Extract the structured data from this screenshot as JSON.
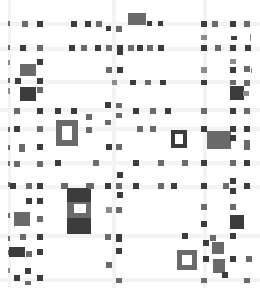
{
  "map": {
    "width": 260,
    "height": 288,
    "background": "#ffffff",
    "colors": {
      "dark": "#3c3c3c",
      "mid": "#6a6a6a",
      "light": "#8c8c8c",
      "road": "#f3f3f3"
    },
    "roads": [
      {
        "x": 0,
        "y": 22,
        "w": 260,
        "h": 4
      },
      {
        "x": 0,
        "y": 47,
        "w": 260,
        "h": 4
      },
      {
        "x": 0,
        "y": 80,
        "w": 260,
        "h": 4
      },
      {
        "x": 0,
        "y": 108,
        "w": 260,
        "h": 4
      },
      {
        "x": 0,
        "y": 127,
        "w": 260,
        "h": 4
      },
      {
        "x": 0,
        "y": 161,
        "w": 260,
        "h": 4
      },
      {
        "x": 0,
        "y": 185,
        "w": 260,
        "h": 4
      },
      {
        "x": 0,
        "y": 234,
        "w": 260,
        "h": 4
      },
      {
        "x": 0,
        "y": 278,
        "w": 260,
        "h": 4
      },
      {
        "x": 8,
        "y": 0,
        "w": 3,
        "h": 288
      },
      {
        "x": 112,
        "y": 0,
        "w": 4,
        "h": 288
      },
      {
        "x": 203,
        "y": 0,
        "w": 4,
        "h": 288
      }
    ],
    "tiles": [
      {
        "x": 8,
        "y": 21,
        "w": 2,
        "h": 5,
        "tone": "mid"
      },
      {
        "x": 22,
        "y": 21,
        "w": 6,
        "h": 6,
        "tone": "mid"
      },
      {
        "x": 37,
        "y": 21,
        "w": 6,
        "h": 6,
        "tone": "dark"
      },
      {
        "x": 71,
        "y": 21,
        "w": 6,
        "h": 6,
        "tone": "dark"
      },
      {
        "x": 85,
        "y": 21,
        "w": 6,
        "h": 6,
        "tone": "dark"
      },
      {
        "x": 96,
        "y": 21,
        "w": 6,
        "h": 6,
        "tone": "mid"
      },
      {
        "x": 106,
        "y": 26,
        "w": 5,
        "h": 5,
        "tone": "dark"
      },
      {
        "x": 116,
        "y": 26,
        "w": 6,
        "h": 6,
        "tone": "mid"
      },
      {
        "x": 128,
        "y": 13,
        "w": 18,
        "h": 12,
        "tone": "mid"
      },
      {
        "x": 147,
        "y": 21,
        "w": 5,
        "h": 5,
        "tone": "dark"
      },
      {
        "x": 158,
        "y": 21,
        "w": 5,
        "h": 5,
        "tone": "dark"
      },
      {
        "x": 201,
        "y": 21,
        "w": 6,
        "h": 6,
        "tone": "dark"
      },
      {
        "x": 212,
        "y": 21,
        "w": 6,
        "h": 6,
        "tone": "mid"
      },
      {
        "x": 230,
        "y": 21,
        "w": 6,
        "h": 6,
        "tone": "dark"
      },
      {
        "x": 244,
        "y": 21,
        "w": 6,
        "h": 6,
        "tone": "mid"
      },
      {
        "x": 8,
        "y": 45,
        "w": 2,
        "h": 5,
        "tone": "mid"
      },
      {
        "x": 20,
        "y": 45,
        "w": 6,
        "h": 6,
        "tone": "dark"
      },
      {
        "x": 37,
        "y": 45,
        "w": 6,
        "h": 6,
        "tone": "mid"
      },
      {
        "x": 69,
        "y": 45,
        "w": 6,
        "h": 6,
        "tone": "dark"
      },
      {
        "x": 81,
        "y": 45,
        "w": 6,
        "h": 6,
        "tone": "mid"
      },
      {
        "x": 95,
        "y": 45,
        "w": 6,
        "h": 6,
        "tone": "dark"
      },
      {
        "x": 106,
        "y": 45,
        "w": 6,
        "h": 6,
        "tone": "mid"
      },
      {
        "x": 117,
        "y": 45,
        "w": 6,
        "h": 10,
        "tone": "dark"
      },
      {
        "x": 128,
        "y": 45,
        "w": 6,
        "h": 6,
        "tone": "mid"
      },
      {
        "x": 137,
        "y": 45,
        "w": 6,
        "h": 6,
        "tone": "dark"
      },
      {
        "x": 147,
        "y": 45,
        "w": 6,
        "h": 6,
        "tone": "mid"
      },
      {
        "x": 158,
        "y": 45,
        "w": 6,
        "h": 6,
        "tone": "dark"
      },
      {
        "x": 201,
        "y": 35,
        "w": 6,
        "h": 5,
        "tone": "light"
      },
      {
        "x": 231,
        "y": 36,
        "w": 6,
        "h": 4,
        "tone": "dark"
      },
      {
        "x": 250,
        "y": 34,
        "w": 1,
        "h": 7,
        "tone": "light"
      },
      {
        "x": 201,
        "y": 45,
        "w": 6,
        "h": 6,
        "tone": "dark"
      },
      {
        "x": 215,
        "y": 45,
        "w": 6,
        "h": 6,
        "tone": "mid"
      },
      {
        "x": 230,
        "y": 45,
        "w": 6,
        "h": 6,
        "tone": "dark"
      },
      {
        "x": 245,
        "y": 45,
        "w": 6,
        "h": 6,
        "tone": "dark"
      },
      {
        "x": 8,
        "y": 60,
        "w": 2,
        "h": 5,
        "tone": "light"
      },
      {
        "x": 37,
        "y": 59,
        "w": 6,
        "h": 6,
        "tone": "dark"
      },
      {
        "x": 20,
        "y": 64,
        "w": 16,
        "h": 12,
        "tone": "mid"
      },
      {
        "x": 106,
        "y": 67,
        "w": 6,
        "h": 6,
        "tone": "mid"
      },
      {
        "x": 117,
        "y": 67,
        "w": 6,
        "h": 6,
        "tone": "dark"
      },
      {
        "x": 230,
        "y": 59,
        "w": 6,
        "h": 5,
        "tone": "light"
      },
      {
        "x": 201,
        "y": 67,
        "w": 6,
        "h": 6,
        "tone": "light"
      },
      {
        "x": 230,
        "y": 67,
        "w": 6,
        "h": 6,
        "tone": "dark"
      },
      {
        "x": 244,
        "y": 66,
        "w": 6,
        "h": 6,
        "tone": "mid"
      },
      {
        "x": 251,
        "y": 68,
        "w": 1,
        "h": 5,
        "tone": "light"
      },
      {
        "x": 8,
        "y": 78,
        "w": 2,
        "h": 5,
        "tone": "mid"
      },
      {
        "x": 15,
        "y": 78,
        "w": 6,
        "h": 6,
        "tone": "dark"
      },
      {
        "x": 37,
        "y": 78,
        "w": 6,
        "h": 6,
        "tone": "dark"
      },
      {
        "x": 112,
        "y": 80,
        "w": 5,
        "h": 5,
        "tone": "light"
      },
      {
        "x": 130,
        "y": 80,
        "w": 6,
        "h": 5,
        "tone": "dark"
      },
      {
        "x": 145,
        "y": 80,
        "w": 6,
        "h": 5,
        "tone": "mid"
      },
      {
        "x": 160,
        "y": 80,
        "w": 6,
        "h": 5,
        "tone": "dark"
      },
      {
        "x": 201,
        "y": 80,
        "w": 6,
        "h": 5,
        "tone": "dark"
      },
      {
        "x": 230,
        "y": 80,
        "w": 6,
        "h": 5,
        "tone": "mid"
      },
      {
        "x": 244,
        "y": 80,
        "w": 6,
        "h": 6,
        "tone": "mid"
      },
      {
        "x": 230,
        "y": 86,
        "w": 14,
        "h": 14,
        "tone": "dark"
      },
      {
        "x": 243,
        "y": 91,
        "w": 6,
        "h": 5,
        "tone": "light"
      },
      {
        "x": 8,
        "y": 88,
        "w": 2,
        "h": 6,
        "tone": "light"
      },
      {
        "x": 20,
        "y": 87,
        "w": 16,
        "h": 14,
        "tone": "dark"
      },
      {
        "x": 37,
        "y": 87,
        "w": 6,
        "h": 6,
        "tone": "mid"
      },
      {
        "x": 105,
        "y": 102,
        "w": 6,
        "h": 6,
        "tone": "dark"
      },
      {
        "x": 116,
        "y": 103,
        "w": 6,
        "h": 5,
        "tone": "mid"
      },
      {
        "x": 116,
        "y": 113,
        "w": 6,
        "h": 5,
        "tone": "mid"
      },
      {
        "x": 105,
        "y": 120,
        "w": 6,
        "h": 5,
        "tone": "mid"
      },
      {
        "x": 14,
        "y": 108,
        "w": 6,
        "h": 6,
        "tone": "mid"
      },
      {
        "x": 37,
        "y": 108,
        "w": 6,
        "h": 6,
        "tone": "dark"
      },
      {
        "x": 55,
        "y": 108,
        "w": 6,
        "h": 6,
        "tone": "dark"
      },
      {
        "x": 71,
        "y": 108,
        "w": 6,
        "h": 6,
        "tone": "dark"
      },
      {
        "x": 86,
        "y": 114,
        "w": 6,
        "h": 6,
        "tone": "mid"
      },
      {
        "x": 133,
        "y": 108,
        "w": 6,
        "h": 6,
        "tone": "dark"
      },
      {
        "x": 150,
        "y": 108,
        "w": 6,
        "h": 6,
        "tone": "mid"
      },
      {
        "x": 165,
        "y": 108,
        "w": 6,
        "h": 6,
        "tone": "dark"
      },
      {
        "x": 201,
        "y": 108,
        "w": 6,
        "h": 6,
        "tone": "mid"
      },
      {
        "x": 230,
        "y": 108,
        "w": 6,
        "h": 6,
        "tone": "dark"
      },
      {
        "x": 244,
        "y": 108,
        "w": 6,
        "h": 6,
        "tone": "mid"
      },
      {
        "x": 8,
        "y": 127,
        "w": 2,
        "h": 5,
        "tone": "mid"
      },
      {
        "x": 14,
        "y": 126,
        "w": 6,
        "h": 6,
        "tone": "dark"
      },
      {
        "x": 37,
        "y": 126,
        "w": 6,
        "h": 6,
        "tone": "mid"
      },
      {
        "x": 86,
        "y": 127,
        "w": 6,
        "h": 6,
        "tone": "mid"
      },
      {
        "x": 137,
        "y": 126,
        "w": 6,
        "h": 6,
        "tone": "mid"
      },
      {
        "x": 150,
        "y": 126,
        "w": 6,
        "h": 6,
        "tone": "mid"
      },
      {
        "x": 201,
        "y": 126,
        "w": 6,
        "h": 6,
        "tone": "dark"
      },
      {
        "x": 230,
        "y": 126,
        "w": 6,
        "h": 6,
        "tone": "dark"
      },
      {
        "x": 244,
        "y": 126,
        "w": 6,
        "h": 6,
        "tone": "dark"
      },
      {
        "x": 207,
        "y": 131,
        "w": 24,
        "h": 18,
        "tone": "mid"
      },
      {
        "x": 230,
        "y": 135,
        "w": 6,
        "h": 6,
        "tone": "dark"
      },
      {
        "x": 244,
        "y": 140,
        "w": 6,
        "h": 5,
        "tone": "mid"
      },
      {
        "x": 8,
        "y": 145,
        "w": 2,
        "h": 5,
        "tone": "mid"
      },
      {
        "x": 19,
        "y": 144,
        "w": 6,
        "h": 8,
        "tone": "mid"
      },
      {
        "x": 37,
        "y": 144,
        "w": 6,
        "h": 6,
        "tone": "dark"
      },
      {
        "x": 106,
        "y": 144,
        "w": 6,
        "h": 6,
        "tone": "dark"
      },
      {
        "x": 116,
        "y": 144,
        "w": 6,
        "h": 6,
        "tone": "mid"
      },
      {
        "x": 244,
        "y": 144,
        "w": 6,
        "h": 6,
        "tone": "mid"
      },
      {
        "x": 8,
        "y": 161,
        "w": 2,
        "h": 5,
        "tone": "mid"
      },
      {
        "x": 14,
        "y": 161,
        "w": 6,
        "h": 6,
        "tone": "mid"
      },
      {
        "x": 37,
        "y": 161,
        "w": 6,
        "h": 6,
        "tone": "mid"
      },
      {
        "x": 55,
        "y": 160,
        "w": 6,
        "h": 6,
        "tone": "dark"
      },
      {
        "x": 93,
        "y": 160,
        "w": 6,
        "h": 6,
        "tone": "mid"
      },
      {
        "x": 133,
        "y": 160,
        "w": 6,
        "h": 6,
        "tone": "dark"
      },
      {
        "x": 158,
        "y": 160,
        "w": 6,
        "h": 6,
        "tone": "mid"
      },
      {
        "x": 182,
        "y": 160,
        "w": 6,
        "h": 6,
        "tone": "mid"
      },
      {
        "x": 201,
        "y": 160,
        "w": 6,
        "h": 6,
        "tone": "dark"
      },
      {
        "x": 230,
        "y": 160,
        "w": 6,
        "h": 6,
        "tone": "mid"
      },
      {
        "x": 244,
        "y": 160,
        "w": 6,
        "h": 6,
        "tone": "dark"
      },
      {
        "x": 117,
        "y": 172,
        "w": 6,
        "h": 6,
        "tone": "dark"
      },
      {
        "x": 8,
        "y": 182,
        "w": 2,
        "h": 5,
        "tone": "mid"
      },
      {
        "x": 10,
        "y": 183,
        "w": 6,
        "h": 6,
        "tone": "dark"
      },
      {
        "x": 26,
        "y": 183,
        "w": 6,
        "h": 6,
        "tone": "mid"
      },
      {
        "x": 37,
        "y": 183,
        "w": 6,
        "h": 6,
        "tone": "dark"
      },
      {
        "x": 61,
        "y": 183,
        "w": 6,
        "h": 6,
        "tone": "mid"
      },
      {
        "x": 86,
        "y": 183,
        "w": 6,
        "h": 6,
        "tone": "mid"
      },
      {
        "x": 105,
        "y": 183,
        "w": 6,
        "h": 6,
        "tone": "dark"
      },
      {
        "x": 116,
        "y": 183,
        "w": 6,
        "h": 6,
        "tone": "mid"
      },
      {
        "x": 133,
        "y": 183,
        "w": 6,
        "h": 6,
        "tone": "dark"
      },
      {
        "x": 158,
        "y": 183,
        "w": 6,
        "h": 6,
        "tone": "mid"
      },
      {
        "x": 171,
        "y": 183,
        "w": 6,
        "h": 6,
        "tone": "dark"
      },
      {
        "x": 201,
        "y": 183,
        "w": 6,
        "h": 6,
        "tone": "dark"
      },
      {
        "x": 223,
        "y": 183,
        "w": 6,
        "h": 6,
        "tone": "mid"
      },
      {
        "x": 230,
        "y": 178,
        "w": 6,
        "h": 6,
        "tone": "dark"
      },
      {
        "x": 230,
        "y": 188,
        "w": 6,
        "h": 6,
        "tone": "dark"
      },
      {
        "x": 244,
        "y": 183,
        "w": 6,
        "h": 6,
        "tone": "dark"
      },
      {
        "x": 117,
        "y": 192,
        "w": 6,
        "h": 6,
        "tone": "dark"
      },
      {
        "x": 26,
        "y": 198,
        "w": 6,
        "h": 6,
        "tone": "dark"
      },
      {
        "x": 37,
        "y": 198,
        "w": 6,
        "h": 6,
        "tone": "dark"
      },
      {
        "x": 106,
        "y": 207,
        "w": 6,
        "h": 6,
        "tone": "light"
      },
      {
        "x": 116,
        "y": 207,
        "w": 6,
        "h": 6,
        "tone": "mid"
      },
      {
        "x": 201,
        "y": 204,
        "w": 6,
        "h": 6,
        "tone": "mid"
      },
      {
        "x": 230,
        "y": 204,
        "w": 6,
        "h": 6,
        "tone": "mid"
      },
      {
        "x": 8,
        "y": 213,
        "w": 2,
        "h": 5,
        "tone": "mid"
      },
      {
        "x": 14,
        "y": 212,
        "w": 16,
        "h": 14,
        "tone": "mid"
      },
      {
        "x": 37,
        "y": 216,
        "w": 6,
        "h": 6,
        "tone": "mid"
      },
      {
        "x": 201,
        "y": 221,
        "w": 6,
        "h": 6,
        "tone": "dark"
      },
      {
        "x": 230,
        "y": 215,
        "w": 14,
        "h": 14,
        "tone": "dark"
      },
      {
        "x": 8,
        "y": 236,
        "w": 2,
        "h": 5,
        "tone": "mid"
      },
      {
        "x": 20,
        "y": 234,
        "w": 6,
        "h": 6,
        "tone": "mid"
      },
      {
        "x": 37,
        "y": 234,
        "w": 6,
        "h": 6,
        "tone": "dark"
      },
      {
        "x": 105,
        "y": 234,
        "w": 6,
        "h": 6,
        "tone": "mid"
      },
      {
        "x": 116,
        "y": 234,
        "w": 6,
        "h": 8,
        "tone": "dark"
      },
      {
        "x": 182,
        "y": 233,
        "w": 6,
        "h": 6,
        "tone": "dark"
      },
      {
        "x": 210,
        "y": 235,
        "w": 6,
        "h": 6,
        "tone": "mid"
      },
      {
        "x": 203,
        "y": 240,
        "w": 6,
        "h": 6,
        "tone": "dark"
      },
      {
        "x": 230,
        "y": 233,
        "w": 6,
        "h": 6,
        "tone": "dark"
      },
      {
        "x": 212,
        "y": 242,
        "w": 12,
        "h": 12,
        "tone": "mid"
      },
      {
        "x": 8,
        "y": 250,
        "w": 2,
        "h": 5,
        "tone": "mid"
      },
      {
        "x": 9,
        "y": 247,
        "w": 16,
        "h": 10,
        "tone": "dark"
      },
      {
        "x": 26,
        "y": 251,
        "w": 6,
        "h": 6,
        "tone": "mid"
      },
      {
        "x": 37,
        "y": 249,
        "w": 6,
        "h": 6,
        "tone": "dark"
      },
      {
        "x": 116,
        "y": 248,
        "w": 6,
        "h": 6,
        "tone": "dark"
      },
      {
        "x": 106,
        "y": 262,
        "w": 6,
        "h": 6,
        "tone": "mid"
      },
      {
        "x": 203,
        "y": 256,
        "w": 6,
        "h": 6,
        "tone": "dark"
      },
      {
        "x": 230,
        "y": 256,
        "w": 6,
        "h": 6,
        "tone": "dark"
      },
      {
        "x": 246,
        "y": 256,
        "w": 6,
        "h": 6,
        "tone": "mid"
      },
      {
        "x": 213,
        "y": 259,
        "w": 12,
        "h": 14,
        "tone": "mid"
      },
      {
        "x": 222,
        "y": 272,
        "w": 6,
        "h": 6,
        "tone": "dark"
      },
      {
        "x": 8,
        "y": 268,
        "w": 2,
        "h": 5,
        "tone": "light"
      },
      {
        "x": 25,
        "y": 268,
        "w": 6,
        "h": 6,
        "tone": "dark"
      },
      {
        "x": 14,
        "y": 275,
        "w": 6,
        "h": 6,
        "tone": "dark"
      },
      {
        "x": 37,
        "y": 275,
        "w": 6,
        "h": 6,
        "tone": "dark"
      },
      {
        "x": 25,
        "y": 281,
        "w": 6,
        "h": 4,
        "tone": "mid"
      },
      {
        "x": 116,
        "y": 278,
        "w": 6,
        "h": 5,
        "tone": "mid"
      },
      {
        "x": 201,
        "y": 278,
        "w": 6,
        "h": 5,
        "tone": "mid"
      },
      {
        "x": 244,
        "y": 278,
        "w": 6,
        "h": 5,
        "tone": "mid"
      }
    ],
    "buildings": [
      {
        "name": "building-north-left",
        "x": 56,
        "y": 120,
        "w": 22,
        "h": 26,
        "border": 6,
        "tone": "mid",
        "window": true
      },
      {
        "name": "building-center-right",
        "x": 171,
        "y": 130,
        "w": 16,
        "h": 18,
        "border": 4,
        "tone": "dark",
        "window": true
      },
      {
        "name": "building-south-tower",
        "x": 67,
        "y": 188,
        "w": 24,
        "h": 46,
        "border": 0,
        "tone": "mid",
        "window": false
      },
      {
        "name": "building-south-right",
        "x": 177,
        "y": 250,
        "w": 20,
        "h": 20,
        "border": 5,
        "tone": "mid",
        "window": true
      }
    ],
    "tower_parts": [
      {
        "x": 67,
        "y": 188,
        "w": 24,
        "h": 14,
        "tone": "dark"
      },
      {
        "x": 67,
        "y": 202,
        "w": 24,
        "h": 16,
        "tone": "mid"
      },
      {
        "x": 74,
        "y": 204,
        "w": 12,
        "h": 9,
        "tone": "white"
      },
      {
        "x": 67,
        "y": 218,
        "w": 24,
        "h": 16,
        "tone": "dark"
      },
      {
        "x": 62,
        "y": 183,
        "w": 6,
        "h": 6,
        "tone": "mid"
      },
      {
        "x": 88,
        "y": 183,
        "w": 6,
        "h": 6,
        "tone": "mid"
      }
    ]
  }
}
